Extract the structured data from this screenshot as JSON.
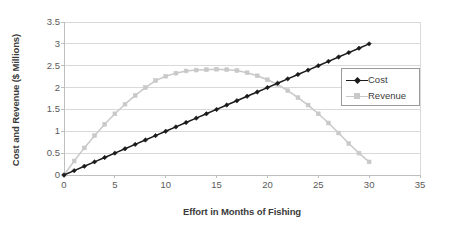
{
  "chart_data": {
    "type": "line",
    "title": "",
    "subtitle": "",
    "xlabel": "Effort in Months of Fishing",
    "ylabel": "Cost and Revenue ($ Millions)",
    "xlim": [
      0,
      35
    ],
    "ylim": [
      0,
      3.5
    ],
    "xticks": [
      "0",
      "5",
      "10",
      "15",
      "20",
      "25",
      "30",
      "35"
    ],
    "xtick_values": [
      0,
      5,
      10,
      15,
      20,
      25,
      30,
      35
    ],
    "yticks": [
      "0",
      "0.5",
      "1",
      "1.5",
      "2",
      "2.5",
      "3",
      "3.5"
    ],
    "ytick_values": [
      0,
      0.5,
      1,
      1.5,
      2,
      2.5,
      3,
      3.5
    ],
    "grid": "horizontal",
    "legend_position": "inside-top-right",
    "x": [
      0,
      1,
      2,
      3,
      4,
      5,
      6,
      7,
      8,
      9,
      10,
      11,
      12,
      13,
      14,
      15,
      16,
      17,
      18,
      19,
      20,
      21,
      22,
      23,
      24,
      25,
      26,
      27,
      28,
      29,
      30
    ],
    "series": [
      {
        "name": "Cost",
        "color": "#1a1a1a",
        "marker": "diamond",
        "values": [
          0,
          0.1,
          0.2,
          0.3,
          0.4,
          0.5,
          0.6,
          0.7,
          0.8,
          0.9,
          1.0,
          1.1,
          1.2,
          1.3,
          1.4,
          1.5,
          1.6,
          1.7,
          1.8,
          1.9,
          2.0,
          2.1,
          2.2,
          2.3,
          2.4,
          2.5,
          2.6,
          2.7,
          2.8,
          2.9,
          3.0
        ]
      },
      {
        "name": "Revenue",
        "color": "#c9c9c9",
        "marker": "square",
        "values": [
          0,
          0.32,
          0.62,
          0.9,
          1.16,
          1.4,
          1.62,
          1.82,
          2.0,
          2.16,
          2.26,
          2.33,
          2.38,
          2.4,
          2.41,
          2.42,
          2.41,
          2.39,
          2.34,
          2.27,
          2.18,
          2.07,
          1.93,
          1.77,
          1.6,
          1.4,
          1.19,
          0.96,
          0.72,
          0.5,
          0.3
        ]
      }
    ],
    "legend": [
      {
        "label": "Cost",
        "color": "#1a1a1a",
        "marker": "diamond"
      },
      {
        "label": "Revenue",
        "color": "#c9c9c9",
        "marker": "square"
      }
    ],
    "colors": {
      "cost": "#1a1a1a",
      "revenue": "#c9c9c9",
      "gridline": "#d9d9d9",
      "axis": "#bfbfbf",
      "text": "#3b3b3b",
      "background": "#ffffff"
    }
  }
}
